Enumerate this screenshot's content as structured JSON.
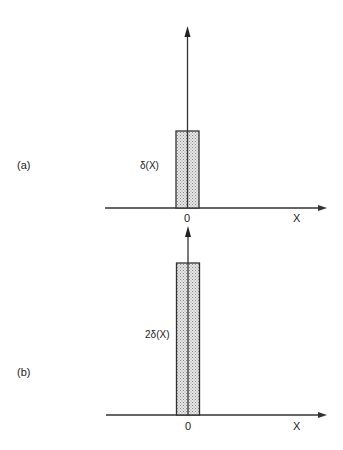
{
  "panels": [
    {
      "id": "a",
      "panel_label": "(a)",
      "function_label": "δ(X)",
      "origin_label": "0",
      "x_axis_label": "X",
      "relative_height": 1
    },
    {
      "id": "b",
      "panel_label": "(b)",
      "function_label": "2δ(X)",
      "origin_label": "0",
      "x_axis_label": "X",
      "relative_height": 2
    }
  ],
  "colors": {
    "line": "#333333",
    "fill_stipple": "#bdbdbd",
    "background": "#ffffff"
  }
}
